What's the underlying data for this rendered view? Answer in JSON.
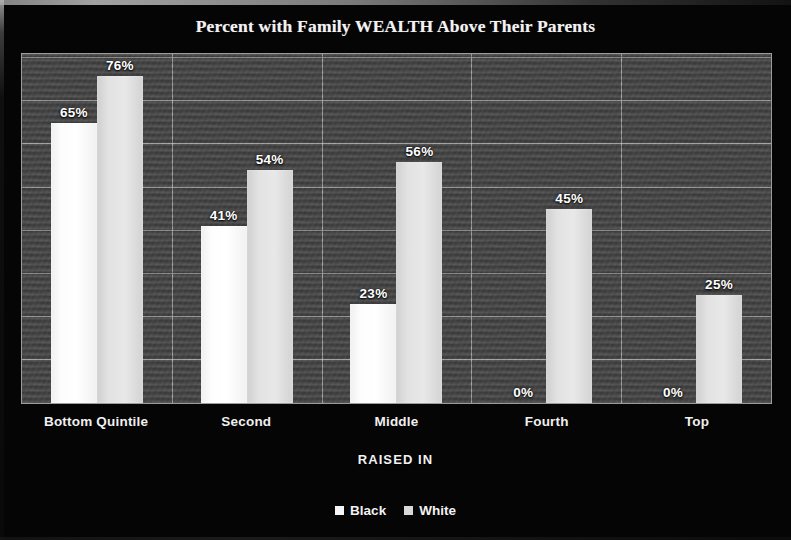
{
  "chart_data": {
    "type": "bar",
    "title": "Percent with Family WEALTH Above Their Parents",
    "xlabel": "RAISED IN",
    "ylabel": "",
    "categories": [
      "Bottom Quintile",
      "Second",
      "Middle",
      "Fourth",
      "Top"
    ],
    "series": [
      {
        "name": "Black",
        "color": "#fafafa",
        "values": [
          65,
          41,
          23,
          0,
          0
        ],
        "value_labels": [
          "65%",
          "41%",
          "23%",
          "0%",
          "0%"
        ]
      },
      {
        "name": "White",
        "color": "#dcdcdc",
        "values": [
          76,
          54,
          56,
          45,
          25
        ],
        "value_labels": [
          "76%",
          "54%",
          "56%",
          "45%",
          "25%"
        ]
      }
    ],
    "ylim": [
      0,
      81
    ],
    "grid": true,
    "gridlines_y": [
      10,
      20,
      30,
      40,
      50,
      60,
      70,
      80
    ],
    "legend_position": "bottom",
    "value_labels_shown": true,
    "plot_background": "#4a4a4a",
    "figure_background": "#050505",
    "text_color": "#ffffff"
  },
  "legend": {
    "items": [
      {
        "label": "Black",
        "swatch_class": "black-series"
      },
      {
        "label": "White",
        "swatch_class": "white-series"
      }
    ]
  }
}
